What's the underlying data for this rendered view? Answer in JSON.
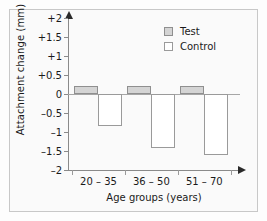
{
  "chart_data": {
    "type": "bar",
    "title": "",
    "xlabel": "Age groups (years)",
    "ylabel": "Attachment change (mm)",
    "categories": [
      "20 – 35",
      "36 – 50",
      "51 – 70"
    ],
    "series": [
      {
        "name": "Test",
        "values": [
          0.2,
          0.2,
          0.2
        ],
        "color": "#d4d4d4"
      },
      {
        "name": "Control",
        "values": [
          -0.85,
          -1.42,
          -1.6
        ],
        "color": "#ffffff"
      }
    ],
    "ylim": [
      -2,
      2
    ],
    "yticks": [
      2,
      1.5,
      1,
      0.5,
      0,
      -0.5,
      -1,
      -1.5,
      -2
    ],
    "ytick_labels": [
      "+2",
      "+1.5",
      "+1",
      "+0.5",
      "0",
      "–0.5",
      "–1",
      "–1.5",
      "–2"
    ],
    "grid": false,
    "legend_position": "top-right",
    "zero_line": 0
  }
}
